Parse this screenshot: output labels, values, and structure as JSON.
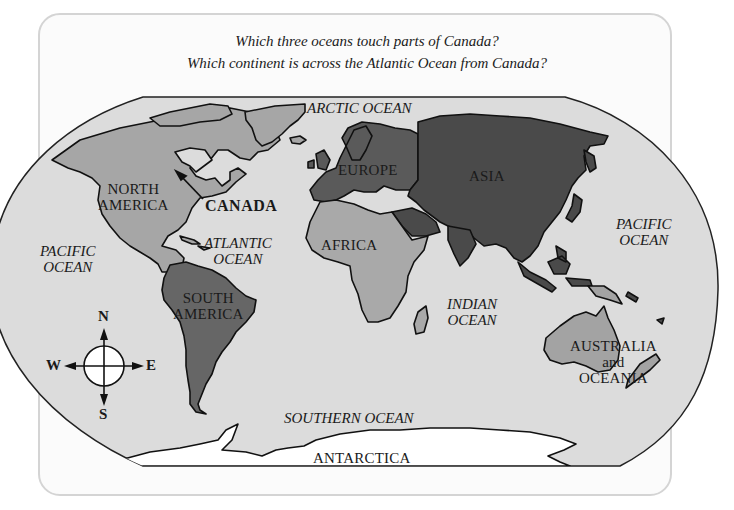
{
  "questions": [
    "Which three oceans touch parts of Canada?",
    "Which continent is across the Atlantic Ocean from Canada?"
  ],
  "colors": {
    "ocean": "#dcdcdc",
    "north_america": "#a6a6a6",
    "south_america": "#666666",
    "europe": "#5a5a5a",
    "asia": "#4a4a4a",
    "africa": "#a9a9a9",
    "australia_oceania": "#a3a3a3",
    "antarctica": "#ffffff",
    "coastline": "#111111",
    "frame_border": "#d4d4d4"
  },
  "map": {
    "oceans": [
      {
        "id": "arctic",
        "label": "ARCTIC OCEAN"
      },
      {
        "id": "pacific-west",
        "line1": "PACIFIC",
        "line2": "OCEAN"
      },
      {
        "id": "atlantic",
        "line1": "ATLANTIC",
        "line2": "OCEAN"
      },
      {
        "id": "indian",
        "line1": "INDIAN",
        "line2": "OCEAN"
      },
      {
        "id": "pacific-east",
        "line1": "PACIFIC",
        "line2": "OCEAN"
      },
      {
        "id": "southern",
        "label": "SOUTHERN OCEAN"
      }
    ],
    "continents": [
      {
        "id": "north-america",
        "line1": "NORTH",
        "line2": "AMERICA"
      },
      {
        "id": "south-america",
        "line1": "SOUTH",
        "line2": "AMERICA"
      },
      {
        "id": "europe",
        "label": "EUROPE"
      },
      {
        "id": "asia",
        "label": "ASIA"
      },
      {
        "id": "africa",
        "label": "AFRICA"
      },
      {
        "id": "australia",
        "line1": "AUSTRALIA",
        "line2": "and",
        "line3": "OCEANIA"
      },
      {
        "id": "antarctica",
        "label": "ANTARCTICA"
      }
    ],
    "callout": {
      "label": "CANADA"
    },
    "compass": {
      "north": "N",
      "south": "S",
      "east": "E",
      "west": "W"
    }
  }
}
